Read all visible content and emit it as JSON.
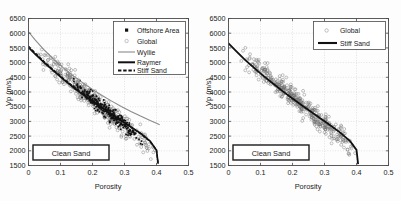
{
  "figure": {
    "background_color": "#fdfdfd",
    "panel_count": 2
  },
  "chart_data": [
    {
      "type": "scatter",
      "panel": "left",
      "title": "",
      "xlabel": "Porosity",
      "ylabel": "Vp (m/s)",
      "xlim": [
        0,
        0.5
      ],
      "ylim": [
        1500,
        6500
      ],
      "xticks": [
        0,
        0.1,
        0.2,
        0.3,
        0.4,
        0.5
      ],
      "xticklabels": [
        "0",
        "0.1",
        "0.2",
        "0.3",
        "0.4",
        "0.5"
      ],
      "yticks": [
        1500,
        2000,
        2500,
        3000,
        3500,
        4000,
        4500,
        5000,
        5500,
        6000,
        6500
      ],
      "yticklabels": [
        "1500",
        "2000",
        "2500",
        "3000",
        "3500",
        "4000",
        "4500",
        "5000",
        "5500",
        "6000",
        "6500"
      ],
      "grid": true,
      "legend_position": "upper right",
      "annotation": "Clean Sand",
      "legend": [
        {
          "label": "Offshore Area",
          "marker": "filled-square",
          "color": "#111111"
        },
        {
          "label": "Global",
          "marker": "open-circle",
          "color": "#6f6f6f"
        },
        {
          "label": "Wyllie",
          "marker": "thin-line",
          "color": "#8a8a8a"
        },
        {
          "label": "Raymer",
          "marker": "thick-line",
          "color": "#111111"
        },
        {
          "label": "Stiff Sand",
          "marker": "dashed-line",
          "color": "#111111"
        }
      ],
      "series": [
        {
          "name": "Wyllie",
          "kind": "line",
          "x": [
            0,
            0.02,
            0.05,
            0.08,
            0.11,
            0.14,
            0.17,
            0.2,
            0.23,
            0.26,
            0.29,
            0.32,
            0.35,
            0.38,
            0.4,
            0.41
          ],
          "values": [
            6050,
            5780,
            5420,
            5100,
            4810,
            4550,
            4310,
            4090,
            3880,
            3690,
            3510,
            3340,
            3180,
            3030,
            2940,
            2890
          ]
        },
        {
          "name": "Raymer",
          "kind": "line",
          "x": [
            0,
            0.02,
            0.05,
            0.08,
            0.11,
            0.14,
            0.17,
            0.2,
            0.23,
            0.26,
            0.29,
            0.32,
            0.35,
            0.38,
            0.4,
            0.405
          ],
          "values": [
            5520,
            5300,
            4990,
            4700,
            4420,
            4160,
            3910,
            3680,
            3450,
            3230,
            3020,
            2810,
            2600,
            2330,
            2020,
            1560
          ]
        },
        {
          "name": "Stiff Sand",
          "kind": "line",
          "x": [
            0,
            0.02,
            0.05,
            0.08,
            0.11,
            0.14,
            0.17,
            0.2,
            0.23,
            0.26,
            0.29,
            0.32,
            0.35,
            0.38,
            0.4,
            0.405
          ],
          "values": [
            5560,
            5340,
            5020,
            4730,
            4450,
            4190,
            3940,
            3700,
            3470,
            3250,
            3030,
            2810,
            2580,
            2310,
            2030,
            1550
          ]
        },
        {
          "name": "Global",
          "kind": "scatter-cloud",
          "marker": "open-circle",
          "x_range": [
            0.02,
            0.4
          ],
          "trend_intercept": 5560,
          "trend_slope": -9000,
          "scatter_sd": 180,
          "n": 420
        },
        {
          "name": "Offshore Area",
          "kind": "scatter-cloud",
          "marker": "filled-square",
          "x_range": [
            0.13,
            0.36
          ],
          "trend_intercept": 5560,
          "trend_slope": -9000,
          "scatter_sd": 120,
          "n": 260
        }
      ]
    },
    {
      "type": "scatter",
      "panel": "right",
      "title": "",
      "xlabel": "Porosity",
      "ylabel": "Vp (m/s)",
      "xlim": [
        0,
        0.5
      ],
      "ylim": [
        1500,
        6500
      ],
      "xticks": [
        0,
        0.1,
        0.2,
        0.3,
        0.4,
        0.5
      ],
      "xticklabels": [
        "0",
        "0.1",
        "0.2",
        "0.3",
        "0.4",
        "0.5"
      ],
      "yticks": [
        1500,
        2000,
        2500,
        3000,
        3500,
        4000,
        4500,
        5000,
        5500,
        6000,
        6500
      ],
      "yticklabels": [
        "1500",
        "2000",
        "2500",
        "3000",
        "3500",
        "4000",
        "4500",
        "5000",
        "5500",
        "6000",
        "6500"
      ],
      "grid": true,
      "legend_position": "upper right",
      "annotation": "Clean Sand",
      "legend": [
        {
          "label": "Global",
          "marker": "open-circle",
          "color": "#6f6f6f"
        },
        {
          "label": "Stiff Sand",
          "marker": "thick-line",
          "color": "#111111"
        }
      ],
      "series": [
        {
          "name": "Stiff Sand",
          "kind": "line",
          "x": [
            0,
            0.02,
            0.05,
            0.08,
            0.11,
            0.14,
            0.17,
            0.2,
            0.23,
            0.26,
            0.29,
            0.32,
            0.35,
            0.38,
            0.4,
            0.405
          ],
          "values": [
            5650,
            5430,
            5110,
            4820,
            4540,
            4280,
            4020,
            3780,
            3540,
            3310,
            3080,
            2850,
            2610,
            2330,
            2030,
            1550
          ]
        },
        {
          "name": "Global",
          "kind": "scatter-cloud",
          "marker": "open-circle",
          "x_range": [
            0.03,
            0.4
          ],
          "trend_intercept": 5650,
          "trend_slope": -9100,
          "scatter_sd": 170,
          "n": 430
        }
      ]
    }
  ]
}
